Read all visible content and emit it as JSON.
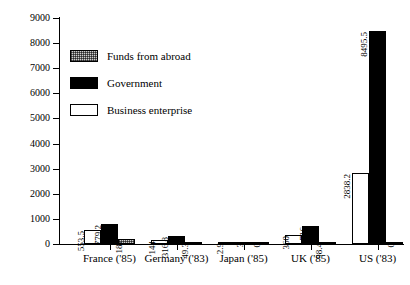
{
  "chart_data": {
    "type": "bar",
    "title": "",
    "subtitle": "",
    "xlabel": "",
    "ylabel": "",
    "ylim": [
      0,
      9000
    ],
    "ytick_labels": [
      "0",
      "1000",
      "2000",
      "3000",
      "4000",
      "5000",
      "6000",
      "7000",
      "8000",
      "9000"
    ],
    "ytick_values": [
      0,
      1000,
      2000,
      3000,
      4000,
      5000,
      6000,
      7000,
      8000,
      9000
    ],
    "grid": false,
    "legend_position": "upper-left-inside",
    "categories": [
      "France ('85)",
      "Germany ('83)",
      "Japan ('85)",
      "UK ('85)",
      "US ('83)"
    ],
    "series": [
      {
        "name": "Business enterprise",
        "swatch": "business",
        "values": [
          553.5,
          144,
          2.9,
          360,
          2838.2
        ],
        "labels": [
          "553.5",
          "144",
          "2.9",
          "360",
          "2838.2"
        ]
      },
      {
        "name": "Government",
        "swatch": "government",
        "values": [
          779.2,
          316.8,
          3,
          716,
          8495.5
        ],
        "labels": [
          "779.2",
          "316.8",
          "3",
          "716",
          "8495.5"
        ]
      },
      {
        "name": "Funds from abroad",
        "swatch": "abroad",
        "values": [
          187,
          49.3,
          0,
          98.4,
          0
        ],
        "labels": [
          "187",
          "49.3",
          "0",
          "98.4",
          "0"
        ]
      }
    ],
    "legend_entries": [
      {
        "label": "Funds from abroad",
        "swatch": "abroad"
      },
      {
        "label": "Government",
        "swatch": "government"
      },
      {
        "label": "Business enterprise",
        "swatch": "business"
      }
    ],
    "colors": {
      "business": "#ffffff",
      "government": "#000000",
      "abroad": "#cfcfcf",
      "axis": "#000000",
      "background": "#ffffff"
    }
  }
}
